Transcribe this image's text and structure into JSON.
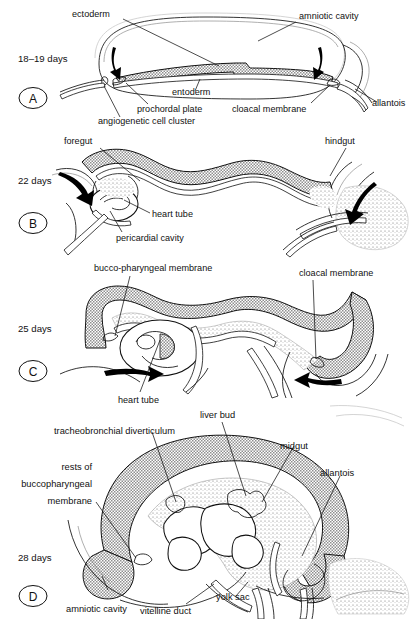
{
  "figure": {
    "type": "embryology-diagram",
    "panel_count": 4
  },
  "panels": [
    {
      "id": "A",
      "letter": "A",
      "stage": "18–19 days",
      "labels": [
        {
          "key": "ectoderm",
          "text": "ectoderm"
        },
        {
          "key": "amniotic_cavity",
          "text": "amniotic cavity"
        },
        {
          "key": "entoderm",
          "text": "entoderm"
        },
        {
          "key": "prochordal_plate",
          "text": "prochordal plate"
        },
        {
          "key": "angiogenetic_cluster",
          "text": "angiogenetic cell cluster"
        },
        {
          "key": "cloacal_membrane",
          "text": "cloacal membrane"
        },
        {
          "key": "allantois",
          "text": "allantois"
        }
      ]
    },
    {
      "id": "B",
      "letter": "B",
      "stage": "22 days",
      "labels": [
        {
          "key": "foregut",
          "text": "foregut"
        },
        {
          "key": "hindgut",
          "text": "hindgut"
        },
        {
          "key": "heart_tube",
          "text": "heart tube"
        },
        {
          "key": "pericardial_cavity",
          "text": "pericardial cavity"
        }
      ]
    },
    {
      "id": "C",
      "letter": "C",
      "stage": "25 days",
      "labels": [
        {
          "key": "bucco_pharyngeal_membrane",
          "text": "bucco-pharyngeal membrane"
        },
        {
          "key": "cloacal_membrane",
          "text": "cloacal membrane"
        },
        {
          "key": "heart_tube",
          "text": "heart tube"
        }
      ]
    },
    {
      "id": "D",
      "letter": "D",
      "stage": "28 days",
      "labels": [
        {
          "key": "tracheobronchial_diverticulum",
          "text": "tracheobronchial diverticulum"
        },
        {
          "key": "liver_bud",
          "text": "liver bud"
        },
        {
          "key": "midgut",
          "text": "midgut"
        },
        {
          "key": "allantois",
          "text": "allantois"
        },
        {
          "key": "rests_line1",
          "text": "rests of"
        },
        {
          "key": "rests_line2",
          "text": "buccopharyngeal"
        },
        {
          "key": "rests_line3",
          "text": "membrane"
        },
        {
          "key": "amniotic_cavity",
          "text": "amniotic cavity"
        },
        {
          "key": "vitelline_duct",
          "text": "vitelline duct"
        },
        {
          "key": "yolk_sac",
          "text": "yolk sac"
        }
      ]
    }
  ],
  "colors": {
    "ink": "#111111",
    "paper": "#ffffff",
    "ectoderm_shade": "#9a9a9a",
    "stipple": "#777777",
    "faint_line": "#8d8d8d"
  }
}
